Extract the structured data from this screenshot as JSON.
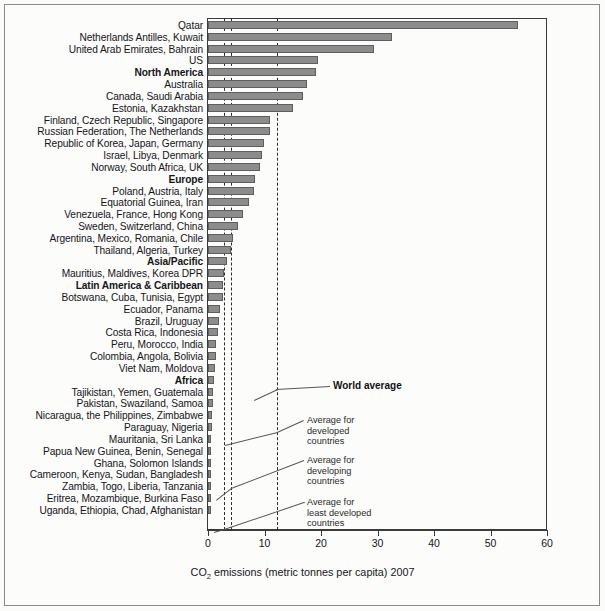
{
  "chart_data": {
    "type": "bar",
    "title": "",
    "orientation": "horizontal",
    "xlabel": "CO2 emissions (metric tonnes per capita) 2007",
    "xlabel_pretty": "CO₂ emissions (metric tonnes per capita) 2007",
    "ylabel": "",
    "xlim": [
      0,
      60
    ],
    "xticks": [
      0,
      10,
      20,
      30,
      40,
      50,
      60
    ],
    "xticklabels": [
      "0",
      "10",
      "20",
      "30",
      "40",
      "50",
      "60"
    ],
    "grid": false,
    "legend": "none",
    "bar_color": "#8c8c8c",
    "bar_edge_color": "#5e5e5e",
    "categories": [
      "Qatar",
      "Netherlands Antilles, Kuwait",
      "United Arab Emirates, Bahrain",
      "US",
      "North America",
      "Australia",
      "Canada, Saudi Arabia",
      "Estonia, Kazakhstan",
      "Finland, Czech Republic, Singapore",
      "Russian Federation, The Netherlands",
      "Republic of Korea, Japan, Germany",
      "Israel, Libya, Denmark",
      "Norway, South Africa, UK",
      "Europe",
      "Poland, Austria, Italy",
      "Equatorial Guinea, Iran",
      "Venezuela, France, Hong Kong",
      "Sweden, Switzerland, China",
      "Argentina, Mexico, Romania, Chile",
      "Thailand, Algeria, Turkey",
      "Asia/Pacific",
      "Mauritius, Maldives, Korea DPR",
      "Latin America & Caribbean",
      "Botswana, Cuba, Tunisia, Egypt",
      "Ecuador, Panama",
      "Brazil, Uruguay",
      "Costa Rica, Indonesia",
      "Peru, Morocco, India",
      "Colombia, Angola, Bolivia",
      "Viet Nam, Moldova",
      "Africa",
      "Tajikistan, Yemen, Guatemala",
      "Pakistan, Swaziland, Samoa",
      "Nicaragua, the Philippines, Zimbabwe",
      "Paraguay, Nigeria",
      "Mauritania, Sri Lanka",
      "Papua New Guinea, Benin, Senegal",
      "Ghana, Solomon Islands",
      "Cameroon, Kenya, Sudan, Bangladesh",
      "Zambia, Togo, Liberia, Tanzania",
      "Eritrea, Mozambique, Burkina Faso",
      "Uganda, Ethiopia, Chad, Afghanistan"
    ],
    "values": [
      54.9,
      32.6,
      29.3,
      19.4,
      19.2,
      17.6,
      16.9,
      15.0,
      11.0,
      10.9,
      9.9,
      9.5,
      9.2,
      8.3,
      8.2,
      7.2,
      6.2,
      5.3,
      4.5,
      4.1,
      3.3,
      2.9,
      2.7,
      2.6,
      2.2,
      2.0,
      1.8,
      1.5,
      1.4,
      1.2,
      1.1,
      0.9,
      0.8,
      0.7,
      0.65,
      0.6,
      0.5,
      0.4,
      0.35,
      0.25,
      0.18,
      0.1
    ],
    "bold_category_indices": [
      4,
      13,
      20,
      22,
      30
    ],
    "reference_lines": [
      {
        "label": "Average for least developed countries",
        "value": 2.8
      },
      {
        "label": "Average for developing countries",
        "value": 4.1
      },
      {
        "label": "World average",
        "value": 12.3
      }
    ]
  },
  "annotations": {
    "world_average": "World average",
    "developed": "Average for\ndeveloped\ncountries",
    "developing": "Average for\ndeveloping\ncountries",
    "least_developed": "Average for\nleast developed\ncountries"
  }
}
